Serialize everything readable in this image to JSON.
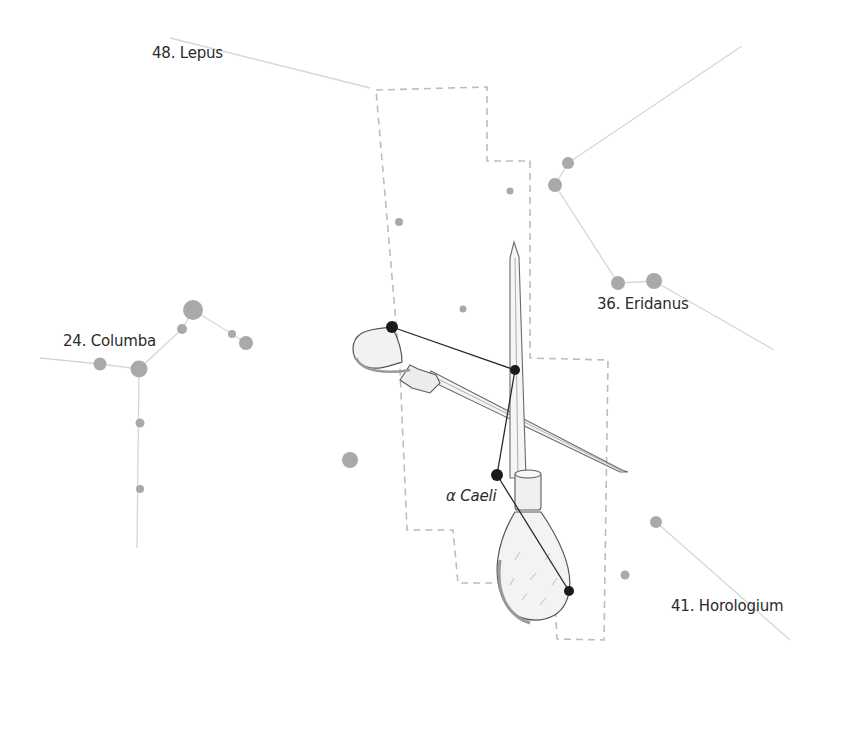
{
  "diagram": {
    "colors": {
      "background": "#ffffff",
      "boundary": "#bdbdbd",
      "neighbor_lines": "#d6d6d6",
      "neighbor_stars": "#a9a9a9",
      "figure_stars": "#1a1a1a",
      "figure_lines": "#2a2a2a",
      "label_text": "#2b2b2b"
    },
    "labels": {
      "lepus": "48. Lepus",
      "eridanus": "36. Eridanus",
      "columba": "24. Columba",
      "horologium": "41. Horologium",
      "alpha_caeli": "α Caeli"
    },
    "boundary_points": [
      [
        376,
        90
      ],
      [
        487,
        87
      ],
      [
        487,
        161
      ],
      [
        530,
        161
      ],
      [
        530,
        358
      ],
      [
        608,
        360
      ],
      [
        604,
        640
      ],
      [
        557,
        639
      ],
      [
        554,
        583
      ],
      [
        458,
        583
      ],
      [
        453,
        530
      ],
      [
        407,
        530
      ],
      [
        400,
        370
      ],
      [
        376,
        90
      ]
    ],
    "figure_stars": [
      {
        "name": "gamma",
        "x": 392,
        "y": 327,
        "r": 6
      },
      {
        "name": "delta",
        "x": 515,
        "y": 370,
        "r": 5
      },
      {
        "name": "alpha",
        "x": 497,
        "y": 475,
        "r": 6
      },
      {
        "name": "beta",
        "x": 569,
        "y": 591,
        "r": 5
      }
    ],
    "figure_lines": [
      [
        392,
        327,
        515,
        370
      ],
      [
        515,
        370,
        497,
        475
      ],
      [
        497,
        475,
        569,
        591
      ]
    ],
    "neighbor_stars": [
      {
        "x": 568,
        "y": 163,
        "r": 6
      },
      {
        "x": 555,
        "y": 185,
        "r": 7
      },
      {
        "x": 618,
        "y": 283,
        "r": 7
      },
      {
        "x": 654,
        "y": 281,
        "r": 8
      },
      {
        "x": 510,
        "y": 191,
        "r": 3.5
      },
      {
        "x": 399,
        "y": 222,
        "r": 4
      },
      {
        "x": 463,
        "y": 309,
        "r": 3.5
      },
      {
        "x": 350,
        "y": 460,
        "r": 8
      },
      {
        "x": 193,
        "y": 310,
        "r": 10
      },
      {
        "x": 182,
        "y": 329,
        "r": 5
      },
      {
        "x": 232,
        "y": 334,
        "r": 4
      },
      {
        "x": 246,
        "y": 343,
        "r": 7
      },
      {
        "x": 100,
        "y": 364,
        "r": 6.5
      },
      {
        "x": 139,
        "y": 369,
        "r": 8.5
      },
      {
        "x": 140,
        "y": 423,
        "r": 4.5
      },
      {
        "x": 140,
        "y": 489,
        "r": 4
      },
      {
        "x": 656,
        "y": 522,
        "r": 6
      },
      {
        "x": 625,
        "y": 575,
        "r": 4.5
      }
    ],
    "neighbor_lines": [
      [
        170,
        38,
        370,
        88
      ],
      [
        568,
        163,
        742,
        46
      ],
      [
        568,
        163,
        555,
        185
      ],
      [
        555,
        185,
        618,
        283
      ],
      [
        618,
        283,
        654,
        281
      ],
      [
        654,
        281,
        774,
        350
      ],
      [
        40,
        358,
        100,
        364
      ],
      [
        100,
        364,
        139,
        369
      ],
      [
        139,
        369,
        182,
        329
      ],
      [
        182,
        329,
        193,
        310
      ],
      [
        193,
        310,
        232,
        334
      ],
      [
        232,
        334,
        246,
        343
      ],
      [
        139,
        369,
        137,
        548
      ],
      [
        656,
        522,
        790,
        640
      ]
    ]
  }
}
